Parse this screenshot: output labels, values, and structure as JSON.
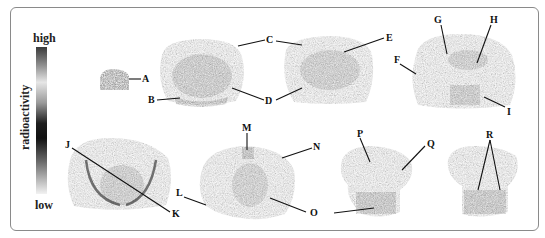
{
  "figure": {
    "type": "autoradiography brain coronal sections",
    "colorbar": {
      "title": "radioactivity",
      "top_label": "high",
      "bottom_label": "low",
      "stops": [
        "#3a3a3a",
        "#8c8c8c",
        "#e6e6e6",
        "#9a9a9a",
        "#1e1e1e",
        "#111111",
        "#6a6a6a",
        "#b5b5b5",
        "#f2f2f2"
      ]
    },
    "sections": [
      {
        "id": "s1",
        "labels": [
          "A"
        ]
      },
      {
        "id": "s2",
        "labels": [
          "B",
          "C",
          "D"
        ]
      },
      {
        "id": "s3",
        "labels": [
          "C",
          "D",
          "E"
        ]
      },
      {
        "id": "s4",
        "labels": [
          "F",
          "G",
          "H",
          "I"
        ]
      },
      {
        "id": "s5",
        "labels": [
          "J",
          "K"
        ]
      },
      {
        "id": "s6",
        "labels": [
          "L",
          "M",
          "N",
          "O"
        ]
      },
      {
        "id": "s7",
        "labels": [
          "P",
          "Q"
        ]
      },
      {
        "id": "s8",
        "labels": [
          "R"
        ]
      }
    ],
    "region_labels": {
      "A": "A",
      "B": "B",
      "C": "C",
      "D": "D",
      "E": "E",
      "F": "F",
      "G": "G",
      "H": "H",
      "I": "I",
      "J": "J",
      "K": "K",
      "L": "L",
      "M": "M",
      "N": "N",
      "O": "O",
      "P": "P",
      "Q": "Q",
      "R": "R"
    },
    "colors": {
      "frame": "#8a8a8a",
      "tissue_base": "#8e8e8e",
      "tissue_dark": "#3c3c3c",
      "label": "#111111"
    }
  }
}
